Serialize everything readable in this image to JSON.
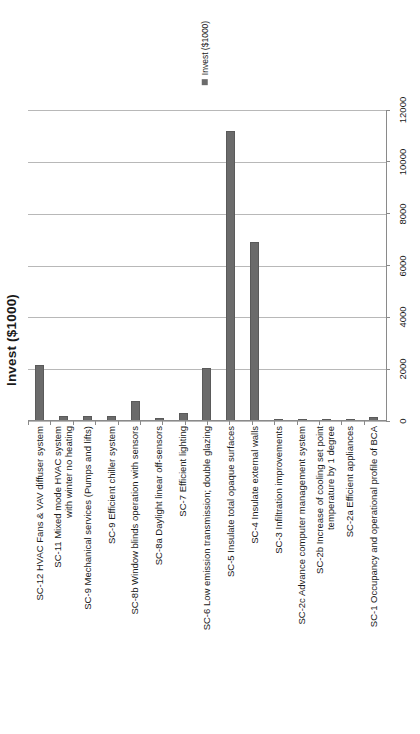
{
  "chart_data": {
    "type": "bar",
    "title": "",
    "xlabel": "",
    "ylabel": "Invest ($1000)",
    "ylim": [
      0,
      12000
    ],
    "yticks": [
      0,
      2000,
      4000,
      6000,
      8000,
      10000,
      12000
    ],
    "grid": true,
    "orientation": "rotated-90-ccw",
    "legend": {
      "position": "top-center",
      "entries": [
        {
          "label": "Invest ($1000)",
          "color": "#6b6b6b",
          "marker": "square"
        }
      ]
    },
    "series": [
      {
        "name": "Invest ($1000)",
        "color": "#6b6b6b",
        "values": [
          2150,
          200,
          180,
          200,
          780,
          100,
          300,
          2050,
          11180,
          6900,
          40,
          90,
          50,
          40,
          150
        ]
      }
    ],
    "categories": [
      "SC-12 HVAC Fans & VAV diffuser system",
      "SC-11 Mixed mode HVAC system with winter no heating",
      "SC-9 Mechanical services (Pumps and lifts)",
      "SC-9 Efficient chiller system",
      "SC-8b Window blinds operation with sensors",
      "SC-8a Daylight linear off-sensors",
      "SC-7 Efficient lighting",
      "SC-6 Low emission transmission; double glazing",
      "SC-5 Insulate total opaque surfaces",
      "SC-4 Insulate external walls",
      "SC-3 Infiltration improvements",
      "SC-2c Advance computer management system",
      "SC-2b Increase of cooling set point temperature by 1 degree",
      "SC-2a Efficient appliances",
      "SC-1 Occupancy and operational profile of BCA"
    ]
  },
  "axis": {
    "value_title": "Invest ($1000)",
    "tick_labels": [
      "0",
      "2000",
      "4000",
      "6000",
      "8000",
      "10000",
      "12000"
    ]
  },
  "legend": {
    "label": "Invest ($1000)"
  },
  "colors": {
    "bar": "#6b6b6b",
    "grid": "#b8b8b8",
    "axis": "#8a8a8a",
    "text": "#1a1a1a",
    "background": "#ffffff"
  }
}
